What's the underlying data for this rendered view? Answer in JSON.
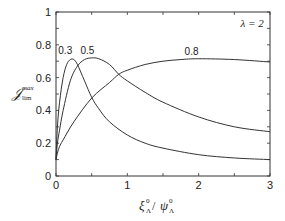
{
  "chart_data": {
    "type": "line",
    "title": "",
    "xlabel": "ξ⁰_Λ / ψ⁰_Λ",
    "xlabel_parts": {
      "num": "ξ",
      "num_sup": "0",
      "num_sub": "Λ",
      "sep": " / ",
      "den": "ψ",
      "den_sup": "0",
      "den_sub": "Λ"
    },
    "ylabel": "J^max_lim",
    "ylabel_parts": {
      "base": "𝒥",
      "sup": "max",
      "sub": "lim"
    },
    "xlim": [
      0,
      3
    ],
    "ylim": [
      0,
      1
    ],
    "xticks": [
      0,
      1,
      2,
      3
    ],
    "xtick_labels": [
      "0",
      "1",
      "2",
      "3"
    ],
    "xminor_step": 0.5,
    "yticks": [
      0,
      0.2,
      0.4,
      0.6,
      0.8,
      1
    ],
    "ytick_labels": [
      "0",
      "0.2",
      "0.4",
      "0.6",
      "0.8",
      "1"
    ],
    "yminor_step": 0.1,
    "grid": false,
    "legend": null,
    "annotations": [
      {
        "text": "λ = 2",
        "x": 2.75,
        "y": 0.93
      }
    ],
    "series": [
      {
        "name": "0.3",
        "label_pos": {
          "x": 0.13,
          "y": 0.745
        },
        "x": [
          0,
          0.02,
          0.05,
          0.1,
          0.15,
          0.2,
          0.25,
          0.3,
          0.4,
          0.5,
          0.6,
          0.75,
          1.0,
          1.25,
          1.5,
          2.0,
          2.5,
          3.0
        ],
        "y": [
          0.1,
          0.3,
          0.45,
          0.6,
          0.68,
          0.71,
          0.71,
          0.68,
          0.58,
          0.48,
          0.41,
          0.33,
          0.25,
          0.2,
          0.17,
          0.13,
          0.11,
          0.1
        ]
      },
      {
        "name": "0.5",
        "label_pos": {
          "x": 0.44,
          "y": 0.745
        },
        "x": [
          0,
          0.02,
          0.05,
          0.1,
          0.2,
          0.3,
          0.4,
          0.5,
          0.6,
          0.75,
          0.88,
          1.0,
          1.25,
          1.5,
          2.0,
          2.5,
          3.0
        ],
        "y": [
          0.1,
          0.2,
          0.28,
          0.4,
          0.58,
          0.67,
          0.71,
          0.72,
          0.715,
          0.68,
          0.62,
          0.58,
          0.51,
          0.45,
          0.36,
          0.3,
          0.27
        ]
      },
      {
        "name": "0.8",
        "label_pos": {
          "x": 1.9,
          "y": 0.74
        },
        "x": [
          0,
          0.02,
          0.05,
          0.1,
          0.25,
          0.5,
          0.75,
          0.88,
          1.0,
          1.25,
          1.5,
          1.75,
          2.0,
          2.5,
          3.0
        ],
        "y": [
          0.1,
          0.14,
          0.18,
          0.22,
          0.33,
          0.475,
          0.57,
          0.62,
          0.645,
          0.68,
          0.7,
          0.71,
          0.715,
          0.71,
          0.695
        ]
      }
    ]
  }
}
